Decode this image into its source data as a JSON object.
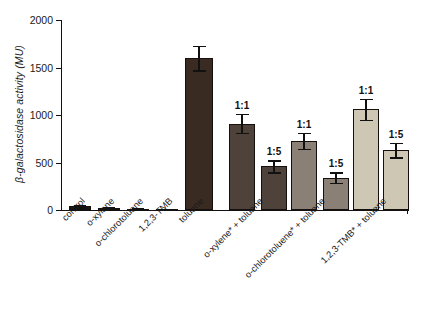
{
  "chart_data": {
    "type": "bar",
    "title": "",
    "xlabel": "",
    "ylabel": "β-galactosidase activity (MU)",
    "ylim": [
      0,
      2000
    ],
    "yticks": [
      0,
      500,
      1000,
      1500,
      2000
    ],
    "ytick_labels": [
      "0",
      "500",
      "1000",
      "1500",
      "2000"
    ],
    "grid": false,
    "legend": "none",
    "categories": [
      "control",
      "o-xylene",
      "o-chlorotoluene",
      "1,2,3-TMB",
      "toluene",
      "o-xylene* + toluene",
      "o-chlorotoluene* + toluene",
      "1,2,3-TMB* + toluene"
    ],
    "bars": [
      {
        "group": "control",
        "ratio": "",
        "value": 40,
        "error": 10,
        "color": "#1b1613"
      },
      {
        "group": "o-xylene",
        "ratio": "",
        "value": 26,
        "error": 8,
        "color": "#1b1613"
      },
      {
        "group": "o-chlorotoluene",
        "ratio": "",
        "value": 13,
        "error": 6,
        "color": "#1b1613"
      },
      {
        "group": "1,2,3-TMB",
        "ratio": "",
        "value": 6,
        "error": 4,
        "color": "#1b1613"
      },
      {
        "group": "toluene",
        "ratio": "",
        "value": 1600,
        "error": 130,
        "color": "#3a2b22"
      },
      {
        "group": "o-xylene* + toluene",
        "ratio": "1:1",
        "value": 910,
        "error": 100,
        "color": "#4e423a"
      },
      {
        "group": "o-xylene* + toluene",
        "ratio": "1:5",
        "value": 460,
        "error": 65,
        "color": "#4e423a"
      },
      {
        "group": "o-chlorotoluene* + toluene",
        "ratio": "1:1",
        "value": 730,
        "error": 85,
        "color": "#8b8075"
      },
      {
        "group": "o-chlorotoluene* + toluene",
        "ratio": "1:5",
        "value": 340,
        "error": 55,
        "color": "#8b8075"
      },
      {
        "group": "1,2,3-TMB* + toluene",
        "ratio": "1:1",
        "value": 1060,
        "error": 110,
        "color": "#cdc7b4"
      },
      {
        "group": "1,2,3-TMB* + toluene",
        "ratio": "1:5",
        "value": 630,
        "error": 75,
        "color": "#cdc7b4"
      }
    ]
  }
}
